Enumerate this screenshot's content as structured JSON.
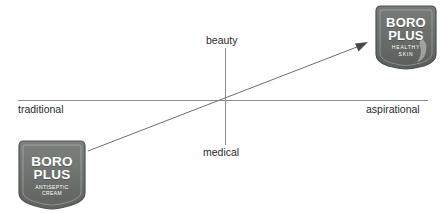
{
  "diagram": {
    "type": "perceptual-map",
    "axes": {
      "horizontal": {
        "left_label": "traditional",
        "right_label": "aspirational"
      },
      "vertical": {
        "top_label": "beauty",
        "bottom_label": "medical"
      }
    },
    "arrow": {
      "description": "repositioning arrow from traditional/medical to aspirational/beauty",
      "from": {
        "x": 88,
        "y": 151
      },
      "to": {
        "x": 368,
        "y": 42
      }
    },
    "marks": [
      {
        "id": "antiseptic",
        "brand_line_1": "BORO",
        "brand_line_2": "PLUS",
        "sub_line_1": "ANTISEPTIC",
        "sub_line_2": "CREAM",
        "position": "traditional / medical",
        "color": "#6f7471"
      },
      {
        "id": "healthy",
        "brand_line_1": "BORO",
        "brand_line_2": "PLUS",
        "sub_line_1": "HEALTHY",
        "sub_line_2": "SKIN",
        "position": "aspirational / beauty",
        "color": "#6b6f6c"
      }
    ],
    "colors": {
      "axis": "#8c8c8c",
      "arrow": "#6e6e6e",
      "label_text": "#2b2b2b",
      "background": "#ffffff"
    }
  }
}
